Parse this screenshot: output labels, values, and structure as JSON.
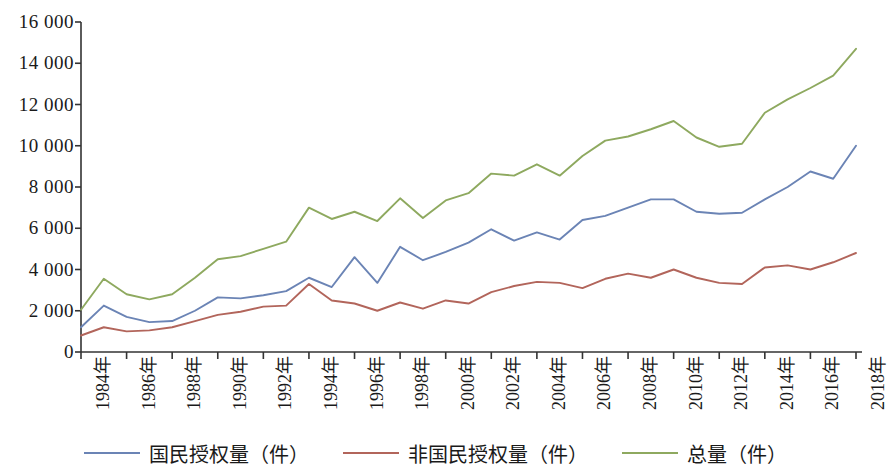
{
  "chart_data": {
    "type": "line",
    "title": "",
    "xlabel": "",
    "ylabel": "",
    "ylim": [
      0,
      16000
    ],
    "ytick_values": [
      0,
      2000,
      4000,
      6000,
      8000,
      10000,
      12000,
      14000,
      16000
    ],
    "ytick_labels": [
      "0",
      "2 000",
      "4 000",
      "6 000",
      "8 000",
      "10 000",
      "12 000",
      "14 000",
      "16 000"
    ],
    "grid": false,
    "legend_position": "bottom",
    "x": [
      1984,
      1985,
      1986,
      1987,
      1988,
      1989,
      1990,
      1991,
      1992,
      1993,
      1994,
      1995,
      1996,
      1997,
      1998,
      1999,
      2000,
      2001,
      2002,
      2003,
      2004,
      2005,
      2006,
      2007,
      2008,
      2009,
      2010,
      2011,
      2012,
      2013,
      2014,
      2015,
      2016,
      2017,
      2018
    ],
    "xtick_x": [
      1984,
      1986,
      1988,
      1990,
      1992,
      1994,
      1996,
      1998,
      2000,
      2002,
      2004,
      2006,
      2008,
      2010,
      2012,
      2014,
      2016,
      2018
    ],
    "xtick_labels": [
      "1984年",
      "1986年",
      "1988年",
      "1990年",
      "1992年",
      "1994年",
      "1996年",
      "1998年",
      "2000年",
      "2002年",
      "2004年",
      "2006年",
      "2008年",
      "2010年",
      "2012年",
      "2014年",
      "2016年",
      "2018年"
    ],
    "series": [
      {
        "name": "国民授权量（件）",
        "color": "#6b84b5",
        "values": [
          1200,
          2250,
          1700,
          1450,
          1500,
          2000,
          2650,
          2600,
          2750,
          2950,
          3600,
          3150,
          4600,
          3350,
          5100,
          4450,
          4850,
          5300,
          5950,
          5400,
          5800,
          5450,
          6400,
          6600,
          7000,
          7400,
          7400,
          6800,
          6700,
          6750,
          7400,
          8000,
          8750,
          8400,
          10000
        ]
      },
      {
        "name": "非国民授权量（件）",
        "color": "#b2655b",
        "values": [
          800,
          1200,
          1000,
          1050,
          1200,
          1500,
          1800,
          1950,
          2200,
          2250,
          3300,
          2500,
          2350,
          2000,
          2400,
          2100,
          2500,
          2350,
          2900,
          3200,
          3400,
          3350,
          3100,
          3550,
          3800,
          3600,
          4000,
          3600,
          3350,
          3300,
          4100,
          4200,
          4000,
          4350,
          4800
        ]
      },
      {
        "name": "总量（件）",
        "color": "#8ea95f",
        "values": [
          2050,
          3550,
          2800,
          2550,
          2800,
          3600,
          4500,
          4650,
          5000,
          5350,
          7000,
          6450,
          6800,
          6350,
          7450,
          6500,
          7350,
          7700,
          8650,
          8550,
          9100,
          8550,
          9500,
          10250,
          10450,
          10800,
          11200,
          10400,
          9950,
          10100,
          11600,
          12250,
          12800,
          13400,
          14700
        ]
      }
    ]
  },
  "legend": {
    "items": [
      {
        "label": "国民授权量（件）",
        "color": "#6b84b5"
      },
      {
        "label": "非国民授权量（件）",
        "color": "#b2655b"
      },
      {
        "label": "总量（件）",
        "color": "#8ea95f"
      }
    ]
  },
  "axis": {
    "axis_color": "#333333"
  }
}
